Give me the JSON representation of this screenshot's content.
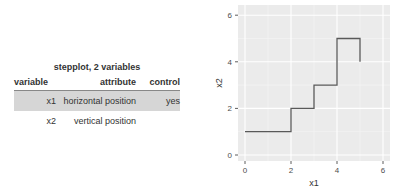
{
  "table": {
    "caption": "stepplot, 2 variables",
    "headers": [
      "variable",
      "attribute",
      "control"
    ],
    "rows": [
      {
        "variable": "x1",
        "attribute": "horizontal position",
        "control": "yes",
        "highlighted": true
      },
      {
        "variable": "x2",
        "attribute": "vertical position",
        "control": "",
        "highlighted": false
      }
    ]
  },
  "chart_data": {
    "type": "line",
    "subtype": "step",
    "x": [
      0,
      2,
      3,
      4,
      5
    ],
    "y": [
      1,
      2,
      3,
      5,
      4
    ],
    "title": "",
    "xlabel": "x1",
    "ylabel": "x2",
    "xlim": [
      0,
      6
    ],
    "ylim": [
      0,
      6
    ],
    "xticks": [
      "0",
      "2",
      "4",
      "6"
    ],
    "yticks": [
      "0",
      "2",
      "4",
      "6"
    ],
    "grid": true,
    "line_color": "#595959",
    "panel_background": "#ebebeb"
  }
}
